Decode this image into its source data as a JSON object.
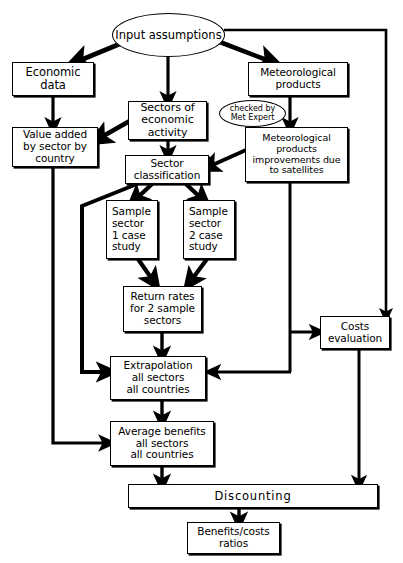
{
  "diagram": {
    "stroke_color": "#000000",
    "fill_color": "#ffffff"
  },
  "nodes": {
    "input_assumptions": {
      "label": "Input assumptions",
      "shape": "ellipse"
    },
    "economic_data": {
      "label": "Economic\ndata",
      "shape": "rect"
    },
    "sectors_of_economic_activity": {
      "label": "Sectors of\neconomic\nactivity",
      "shape": "rect"
    },
    "meteorological_products": {
      "label": "Meteorological\nproducts",
      "shape": "rect"
    },
    "checked_by_met_expert": {
      "label": "checked by\nMet Expert",
      "shape": "ellipse"
    },
    "value_added": {
      "label": "Value added\nby sector  by\ncountry",
      "shape": "rect"
    },
    "met_products_improvements": {
      "label": "Meteorological\nproducts\nimprovements due\nto satellites",
      "shape": "rect"
    },
    "sector_classification": {
      "label": "Sector\nclassification",
      "shape": "rect"
    },
    "sample_sector_1": {
      "label": "Sample\nsector\n1 case\nstudy",
      "shape": "rect"
    },
    "sample_sector_2": {
      "label": "Sample\nsector\n2 case\nstudy",
      "shape": "rect"
    },
    "return_rates": {
      "label": "Return rates\nfor 2 sample\nsectors",
      "shape": "rect"
    },
    "costs_evaluation": {
      "label": "Costs\nevaluation",
      "shape": "rect"
    },
    "extrapolation": {
      "label": "Extrapolation\nall sectors\nall countries",
      "shape": "rect"
    },
    "average_benefits": {
      "label": "Average benefits\nall sectors\nall countries",
      "shape": "rect"
    },
    "discounting": {
      "label": "Discounting",
      "shape": "rect"
    },
    "benefits_costs_ratios": {
      "label": "Benefits/costs\nratios",
      "shape": "rect"
    }
  },
  "edges": [
    {
      "from": "input_assumptions",
      "to": "economic_data",
      "style": "thick-diagonal-arrow"
    },
    {
      "from": "input_assumptions",
      "to": "sectors_of_economic_activity",
      "style": "arrow-down"
    },
    {
      "from": "input_assumptions",
      "to": "meteorological_products",
      "style": "thick-diagonal-arrow"
    },
    {
      "from": "input_assumptions",
      "to": "costs_evaluation",
      "style": "right-then-down-arrow"
    },
    {
      "from": "economic_data",
      "to": "value_added",
      "style": "arrow-down"
    },
    {
      "from": "sectors_of_economic_activity",
      "to": "value_added",
      "style": "thick-diagonal-arrow"
    },
    {
      "from": "sectors_of_economic_activity",
      "to": "sector_classification",
      "style": "arrow-down"
    },
    {
      "from": "meteorological_products",
      "to": "met_products_improvements",
      "style": "arrow-down"
    },
    {
      "from": "met_products_improvements",
      "to": "sector_classification",
      "style": "thick-diagonal-arrow"
    },
    {
      "from": "met_products_improvements",
      "to": "costs_evaluation",
      "style": "down-then-right-arrow"
    },
    {
      "from": "met_products_improvements",
      "to": "extrapolation",
      "style": "down-then-left-arrow"
    },
    {
      "from": "sector_classification",
      "to": "sample_sector_1",
      "style": "thick-diagonal-arrow"
    },
    {
      "from": "sector_classification",
      "to": "sample_sector_2",
      "style": "thick-diagonal-arrow"
    },
    {
      "from": "sector_classification",
      "to": "extrapolation",
      "style": "left-down-then-right-arrow"
    },
    {
      "from": "sample_sector_1",
      "to": "return_rates",
      "style": "thick-diagonal-arrow"
    },
    {
      "from": "sample_sector_2",
      "to": "return_rates",
      "style": "thick-diagonal-arrow"
    },
    {
      "from": "return_rates",
      "to": "extrapolation",
      "style": "arrow-down"
    },
    {
      "from": "value_added",
      "to": "average_benefits",
      "style": "down-then-right-arrow"
    },
    {
      "from": "extrapolation",
      "to": "average_benefits",
      "style": "arrow-down"
    },
    {
      "from": "average_benefits",
      "to": "discounting",
      "style": "arrow-down"
    },
    {
      "from": "costs_evaluation",
      "to": "discounting",
      "style": "arrow-down"
    },
    {
      "from": "discounting",
      "to": "benefits_costs_ratios",
      "style": "arrow-down"
    }
  ]
}
